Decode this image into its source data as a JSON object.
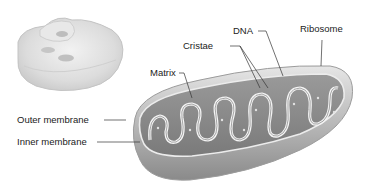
{
  "diagram": {
    "inset": "cell-overview-illustration",
    "labels": {
      "dna": "DNA",
      "ribosome": "Ribosome",
      "cristae": "Cristae",
      "matrix": "Matrix",
      "outer_membrane": "Outer membrane",
      "inner_membrane": "Inner membrane"
    },
    "colors": {
      "text": "#222222",
      "leader_line": "#333333",
      "outer_shell": "#b8b8b8",
      "inner_fill": "#8e8e8e",
      "cristae_membrane": "#f4f4f4",
      "background": "#ffffff"
    }
  }
}
